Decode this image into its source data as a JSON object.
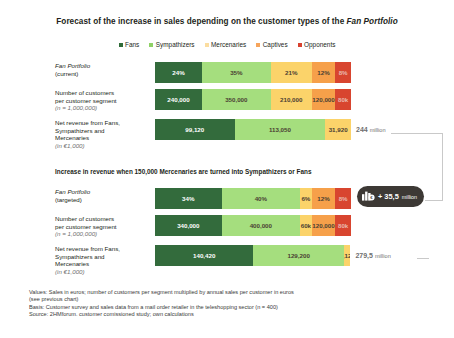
{
  "title": {
    "text_before": "Forecast of the increase in sales depending on the customer types of the ",
    "text_italic": "Fan Portfolio"
  },
  "legend": {
    "items": [
      {
        "label": "Fans",
        "color": "#2f6b38"
      },
      {
        "label": "Sympathizers",
        "color": "#8fd166"
      },
      {
        "label": "Mercenaries",
        "color": "#fbdda0"
      },
      {
        "label": "Captives",
        "color": "#f6a55c"
      },
      {
        "label": "Opponents",
        "color": "#d8412f"
      }
    ]
  },
  "colors": {
    "fans": "#336b3c",
    "sympathizers": "#a5de7e",
    "mercenaries": "#fbd36a",
    "captives": "#f6a04a",
    "opponents": "#d8452f",
    "mercenaries_light": "#fbd98e",
    "badge_bg": "#3d3935",
    "total_text": "#6f6f6f",
    "connector": "#c9c9c9"
  },
  "section_note": "Increase in revenue when 150,000 Mercenaries are turned into Sympathizers or Fans",
  "badge": {
    "icon": "bar-chart-euro-icon",
    "value": "+ 35,5",
    "unit": "million"
  },
  "chart_data": {
    "type": "bar",
    "orientation": "horizontal-stacked",
    "title": "Forecast of the increase in sales depending on the customer types of the Fan Portfolio",
    "xlabel": "",
    "ylabel": "",
    "categories": [
      "Fans",
      "Sympathizers",
      "Mercenaries",
      "Captives",
      "Opponents"
    ],
    "panels": [
      {
        "name": "current",
        "rows": [
          {
            "label_line1": "Fan Portfolio",
            "label_line1_italic": true,
            "label_line2": "(current)",
            "label_sub": "",
            "unit": "%",
            "segments": [
              {
                "series": "Fans",
                "value": 24,
                "label": "24%",
                "width_pct": 24,
                "text": "white"
              },
              {
                "series": "Sympathizers",
                "value": 35,
                "label": "35%",
                "width_pct": 35,
                "text": "dark"
              },
              {
                "series": "Mercenaries",
                "value": 21,
                "label": "21%",
                "width_pct": 21,
                "text": "dark"
              },
              {
                "series": "Captives",
                "value": 12,
                "label": "12%",
                "width_pct": 12,
                "text": "dark"
              },
              {
                "series": "Opponents",
                "value": 8,
                "label": "8%",
                "width_pct": 8,
                "text": "pale"
              }
            ]
          },
          {
            "label_line1": "Number of customers",
            "label_line1_italic": false,
            "label_line2": "per customer segment",
            "label_sub": "(n = 1,000,000)",
            "unit": "customers",
            "segments": [
              {
                "series": "Fans",
                "value": 240000,
                "label": "240,000",
                "width_pct": 24,
                "text": "white"
              },
              {
                "series": "Sympathizers",
                "value": 350000,
                "label": "350,000",
                "width_pct": 35,
                "text": "dark"
              },
              {
                "series": "Mercenaries",
                "value": 210000,
                "label": "210,000",
                "width_pct": 21,
                "text": "dark"
              },
              {
                "series": "Captives",
                "value": 120000,
                "label": "120,000",
                "width_pct": 12,
                "text": "dark"
              },
              {
                "series": "Opponents",
                "value": 80000,
                "label": "80k",
                "width_pct": 8,
                "text": "pale"
              }
            ]
          },
          {
            "label_line1": "Net revenue from Fans,",
            "label_line1_italic": false,
            "label_line2": "Sympathizers and",
            "label_line3": "Mercenaries",
            "label_sub": "(in €1,000)",
            "unit": "€1,000",
            "segments": [
              {
                "series": "Fans",
                "value": 99120,
                "label": "99,120",
                "width_pct": 40.6,
                "text": "white"
              },
              {
                "series": "Sympathizers",
                "value": 113050,
                "label": "113,050",
                "width_pct": 46.3,
                "text": "dark"
              },
              {
                "series": "Mercenaries",
                "value": 31920,
                "label": "31,920",
                "width_pct": 13.1,
                "text": "dark"
              }
            ],
            "total": "244",
            "total_unit": "million"
          }
        ]
      },
      {
        "name": "targeted",
        "rows": [
          {
            "label_line1": "Fan Portfolio",
            "label_line1_italic": true,
            "label_line2": "(targeted)",
            "label_sub": "",
            "unit": "%",
            "segments": [
              {
                "series": "Fans",
                "value": 34,
                "label": "34%",
                "width_pct": 34,
                "text": "white"
              },
              {
                "series": "Sympathizers",
                "value": 40,
                "label": "40%",
                "width_pct": 40,
                "text": "dark"
              },
              {
                "series": "Mercenaries",
                "value": 6,
                "label": "6%",
                "width_pct": 6,
                "text": "dark"
              },
              {
                "series": "Captives",
                "value": 12,
                "label": "12%",
                "width_pct": 12,
                "text": "dark"
              },
              {
                "series": "Opponents",
                "value": 8,
                "label": "8%",
                "width_pct": 8,
                "text": "pale"
              }
            ]
          },
          {
            "label_line1": "Number of customers",
            "label_line1_italic": false,
            "label_line2": "per customer segment",
            "label_sub": "(n = 1,000,000)",
            "unit": "customers",
            "segments": [
              {
                "series": "Fans",
                "value": 340000,
                "label": "340,000",
                "width_pct": 34,
                "text": "white"
              },
              {
                "series": "Sympathizers",
                "value": 400000,
                "label": "400,000",
                "width_pct": 40,
                "text": "dark"
              },
              {
                "series": "Mercenaries",
                "value": 60000,
                "label": "60k",
                "width_pct": 6,
                "text": "dark"
              },
              {
                "series": "Captives",
                "value": 120000,
                "label": "120,000",
                "width_pct": 12,
                "text": "dark"
              },
              {
                "series": "Opponents",
                "value": 80000,
                "label": "80k",
                "width_pct": 8,
                "text": "pale"
              }
            ]
          },
          {
            "label_line1": "Net revenue from Fans,",
            "label_line1_italic": false,
            "label_line2": "Sympathizers and",
            "label_line3": "Mercenaries",
            "label_sub": "(in €1,000)",
            "unit": "€1,000",
            "segments": [
              {
                "series": "Fans",
                "value": 140420,
                "label": "140,420",
                "width_pct": 50.2,
                "text": "white"
              },
              {
                "series": "Sympathizers",
                "value": 129200,
                "label": "129,200",
                "width_pct": 46.2,
                "text": "dark"
              },
              {
                "series": "Mercenaries",
                "value": 9120,
                "label": "9,120",
                "width_pct": 3.3,
                "text": "dark"
              }
            ],
            "total": "279,5",
            "total_unit": "million"
          }
        ]
      }
    ]
  },
  "footnotes": [
    "Values: Sales in euros; number of customers per segment multiplied by annual sales per customer in euros",
    "(see previous chart)",
    "Basis: Customer survey and sales data from a mail order retailer in the teleshopping sector (n = 400)",
    "Source: 2HMforum. customer comissioned study; own calculations"
  ]
}
